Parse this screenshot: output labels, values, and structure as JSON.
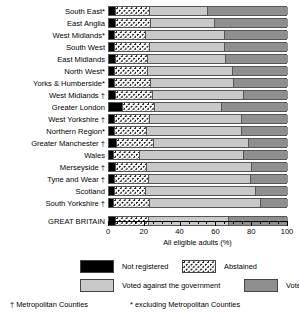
{
  "chart_data": {
    "type": "bar",
    "orientation": "horizontal",
    "stacked": true,
    "title": "",
    "xlabel": "All eligible adults (%)",
    "ylabel": "",
    "xlim": [
      0,
      100
    ],
    "xticks": [
      0,
      20,
      40,
      60,
      80,
      100
    ],
    "xticklabels": [
      "0",
      "20",
      "40",
      "60",
      "80",
      "100"
    ],
    "minor_tick_interval": 5,
    "grid": false,
    "legend_position": "below",
    "series": [
      {
        "name": "Not registered",
        "key": "notreg",
        "color": "#000000"
      },
      {
        "name": "Abstained",
        "key": "abst",
        "color": "#ffffff"
      },
      {
        "name": "Voted against the government",
        "key": "against",
        "color": "#c9c9c9"
      },
      {
        "name": "Voted Conservative",
        "key": "cons",
        "color": "#8f8f8f"
      }
    ],
    "categories": [
      "South East*",
      "East Anglia",
      "West Midlands*",
      "South West",
      "East Midlands",
      "North West*",
      "Yorks & Humberside*",
      "West Midlands †",
      "Greater London",
      "West Yorkshire †",
      "Northern Region*",
      "Greater Manchester †",
      "Wales",
      "Merseyside †",
      "Tyne and Wear †",
      "Scotland",
      "South Yorkshire †",
      "GREAT BRITAIN"
    ],
    "rows": [
      {
        "label": "South East*",
        "notreg": 3.5,
        "abst": 19.0,
        "against": 32.0,
        "cons": 45.5
      },
      {
        "label": "East Anglia",
        "notreg": 3.5,
        "abst": 19.5,
        "against": 35.5,
        "cons": 41.5
      },
      {
        "label": "West Midlands*",
        "notreg": 3.0,
        "abst": 17.0,
        "against": 44.0,
        "cons": 36.0
      },
      {
        "label": "South West",
        "notreg": 3.0,
        "abst": 19.5,
        "against": 42.0,
        "cons": 35.5
      },
      {
        "label": "East Midlands",
        "notreg": 3.5,
        "abst": 18.0,
        "against": 43.5,
        "cons": 35.0
      },
      {
        "label": "North West*",
        "notreg": 3.0,
        "abst": 18.5,
        "against": 47.0,
        "cons": 31.5
      },
      {
        "label": "Yorks & Humberside*",
        "notreg": 3.0,
        "abst": 20.0,
        "against": 46.5,
        "cons": 30.5
      },
      {
        "label": "West Midlands †",
        "notreg": 3.5,
        "abst": 20.5,
        "against": 51.0,
        "cons": 25.0
      },
      {
        "label": "Greater London",
        "notreg": 7.5,
        "abst": 17.5,
        "against": 37.5,
        "cons": 37.5
      },
      {
        "label": "West Yorkshire †",
        "notreg": 3.0,
        "abst": 19.5,
        "against": 51.0,
        "cons": 26.5
      },
      {
        "label": "Northern Region*",
        "notreg": 3.0,
        "abst": 17.5,
        "against": 53.5,
        "cons": 26.0
      },
      {
        "label": "Greater Manchester †",
        "notreg": 4.0,
        "abst": 20.5,
        "against": 53.0,
        "cons": 22.5
      },
      {
        "label": "Wales",
        "notreg": 2.5,
        "abst": 14.5,
        "against": 58.0,
        "cons": 25.0
      },
      {
        "label": "Merseyside †",
        "notreg": 3.5,
        "abst": 17.0,
        "against": 59.0,
        "cons": 20.5
      },
      {
        "label": "Tyne and Wear †",
        "notreg": 3.0,
        "abst": 19.0,
        "against": 57.0,
        "cons": 21.0
      },
      {
        "label": "Scotland",
        "notreg": 3.0,
        "abst": 17.0,
        "against": 61.5,
        "cons": 18.5
      },
      {
        "label": "South Yorkshire †",
        "notreg": 2.5,
        "abst": 20.0,
        "against": 62.0,
        "cons": 15.5
      }
    ],
    "total_row": {
      "label": "GREAT BRITAIN",
      "notreg": 3.5,
      "abst": 18.5,
      "against": 44.5,
      "cons": 33.5
    }
  },
  "legend": {
    "items": [
      {
        "label": "Not registered",
        "swatch": "sw-notreg"
      },
      {
        "label": "Abstained",
        "swatch": "sw-abst"
      },
      {
        "label": "Voted against the government",
        "swatch": "sw-against"
      },
      {
        "label": "Voted Conservative",
        "swatch": "sw-cons"
      }
    ]
  },
  "footnotes": {
    "metropolitan": "† Metropolitan Counties",
    "excluding": "* excluding Metropolitan Counties"
  },
  "axis": {
    "title": "All eligible adults (%)",
    "labels": [
      "0",
      "20",
      "40",
      "60",
      "80",
      "100"
    ]
  }
}
